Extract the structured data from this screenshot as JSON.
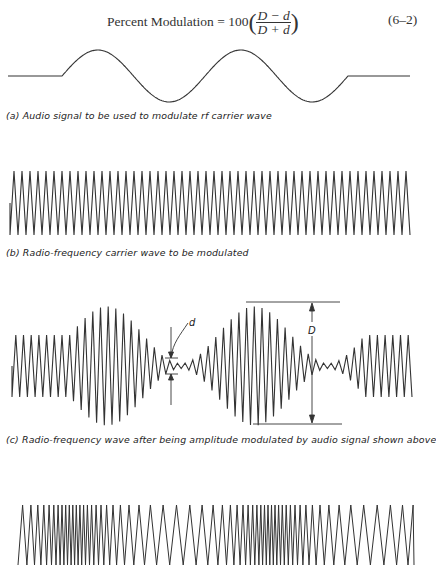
{
  "equation": {
    "lhs": "Percent Modulation = 100",
    "numerator": "D − d",
    "denominator": "D + d",
    "number": "(6–2)"
  },
  "figures": [
    {
      "id": "a",
      "caption": "(a) Audio signal to be used to modulate  rf carrier wave",
      "type": "audio-sine",
      "flat_left": [
        8,
        62
      ],
      "sine_span": [
        62,
        348
      ],
      "flat_right": [
        348,
        410
      ],
      "center_y": 76,
      "amplitude": 26,
      "cycles": 2
    },
    {
      "id": "b",
      "caption": "(b) Radio-frequency carrier wave to be modulated",
      "type": "carrier",
      "x_range": [
        10,
        410
      ],
      "center_y": 203,
      "amplitude": 32,
      "cycles": 50
    },
    {
      "id": "c",
      "caption": "(c) Radio-frequency wave after being amplitude modulated by audio signal shown above",
      "type": "am",
      "x_range": [
        12,
        412
      ],
      "center_y": 366,
      "base_amplitude": 31,
      "modulation_span": [
        70,
        365
      ],
      "cycles": 52,
      "labels": {
        "D": "D",
        "d": "d"
      }
    },
    {
      "id": "d",
      "caption": "",
      "type": "fm",
      "x_range": [
        18,
        414
      ],
      "center_y": 535,
      "amplitude": 30
    }
  ]
}
